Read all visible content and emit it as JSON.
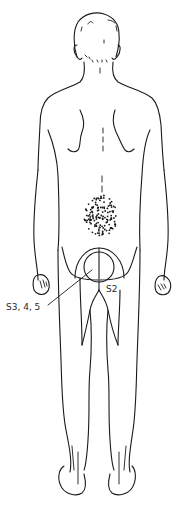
{
  "diagram": {
    "view": "posterior",
    "labels": {
      "s2": "S2",
      "s345": "S3, 4, 5"
    },
    "colors": {
      "line": "#1a1a1a",
      "background": "#ffffff"
    }
  }
}
